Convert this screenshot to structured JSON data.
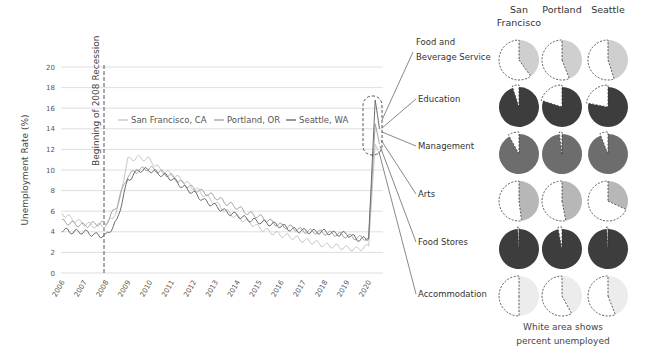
{
  "chart_data": [
    {
      "type": "line",
      "title": "",
      "xlabel": "",
      "ylabel": "Unemployment Rate (%)",
      "ylim": [
        0,
        20
      ],
      "yticks": [
        0,
        2,
        4,
        6,
        8,
        10,
        12,
        14,
        16,
        18,
        20
      ],
      "xticks": [
        "2006",
        "2007",
        "2008",
        "2009",
        "2010",
        "2011",
        "2012",
        "2013",
        "2014",
        "2015",
        "2016",
        "2017",
        "2018",
        "2019",
        "2020"
      ],
      "grid": true,
      "legend_position": "top-center inside",
      "annotation": {
        "label": "Beginning of 2008 Recession",
        "x": 2007.9,
        "style": "dashed vertical line"
      },
      "highlight": {
        "label": "2020 spike",
        "x": 2020.3,
        "y_range": [
          11.5,
          17
        ],
        "style": "dashed rounded rectangle"
      },
      "x": [
        2006.0,
        2006.5,
        2007.0,
        2007.5,
        2008.0,
        2008.5,
        2009.0,
        2009.5,
        2010.0,
        2010.5,
        2011.0,
        2011.5,
        2012.0,
        2012.5,
        2013.0,
        2013.5,
        2014.0,
        2014.5,
        2015.0,
        2015.5,
        2016.0,
        2016.5,
        2017.0,
        2017.5,
        2018.0,
        2018.5,
        2019.0,
        2019.5,
        2020.0,
        2020.3,
        2020.5
      ],
      "series": [
        {
          "name": "San Francisco, CA",
          "color": "#c8c8c8",
          "values": [
            5.8,
            5.2,
            4.8,
            4.6,
            4.6,
            6.0,
            11.0,
            11.2,
            11.0,
            10.0,
            9.6,
            9.0,
            8.3,
            7.6,
            6.8,
            6.0,
            5.4,
            5.0,
            4.4,
            4.0,
            3.7,
            3.5,
            3.2,
            3.0,
            2.7,
            2.6,
            2.4,
            2.3,
            2.6,
            12.5,
            11.5
          ]
        },
        {
          "name": "Portland, OR",
          "color": "#a5a5a5",
          "values": [
            5.0,
            4.8,
            4.6,
            4.8,
            4.8,
            6.5,
            9.5,
            10.0,
            10.2,
            9.8,
            9.4,
            8.7,
            8.2,
            7.8,
            7.4,
            6.8,
            6.4,
            5.8,
            5.5,
            5.0,
            4.6,
            4.4,
            4.1,
            4.0,
            3.9,
            3.8,
            3.6,
            3.4,
            3.4,
            14.5,
            12.5
          ]
        },
        {
          "name": "Seattle, WA",
          "color": "#6e6e6e",
          "values": [
            4.2,
            4.0,
            4.0,
            3.7,
            3.6,
            5.0,
            9.0,
            10.0,
            10.0,
            9.6,
            9.2,
            8.4,
            7.8,
            7.0,
            6.5,
            5.9,
            5.6,
            5.2,
            5.0,
            4.8,
            4.6,
            4.2,
            4.1,
            4.0,
            4.0,
            3.8,
            3.8,
            3.3,
            3.3,
            16.8,
            14.0
          ]
        }
      ]
    },
    {
      "type": "pie",
      "title": "",
      "note": "White area shows percent unemployed",
      "columns": [
        "San Francisco",
        "Portland",
        "Seattle"
      ],
      "rows": [
        {
          "sector": "Food and Beverage Service",
          "color": "#cfcfcf",
          "unemployed_pct": [
            60,
            56,
            55
          ]
        },
        {
          "sector": "Education",
          "color": "#3d3d3d",
          "unemployed_pct": [
            5,
            20,
            22
          ]
        },
        {
          "sector": "Management",
          "color": "#6d6d6d",
          "unemployed_pct": [
            8,
            2,
            6
          ]
        },
        {
          "sector": "Arts",
          "color": "#b7b7b7",
          "unemployed_pct": [
            52,
            53,
            68
          ]
        },
        {
          "sector": "Food Stores",
          "color": "#3d3d3d",
          "unemployed_pct": [
            1,
            3,
            1
          ]
        },
        {
          "sector": "Accommodation",
          "color": "#ececec",
          "unemployed_pct": [
            50,
            58,
            56
          ]
        }
      ]
    }
  ],
  "labels": {
    "ylabel": "Unemployment Rate (%)",
    "recession": "Beginning of 2008 Recession",
    "note_line1": "White area shows",
    "note_line2": "percent unemployed",
    "city_sf_1": "San",
    "city_sf_2": "Francisco",
    "city_pdx": "Portland",
    "city_sea": "Seattle",
    "sector_fbs_1": "Food and",
    "sector_fbs_2": "Beverage Service",
    "sector_edu": "Education",
    "sector_mgmt": "Management",
    "sector_arts": "Arts",
    "sector_fs": "Food Stores",
    "sector_acc": "Accommodation",
    "legend_sf": "San Francisco, CA",
    "legend_pdx": "Portland, OR",
    "legend_sea": "Seattle, WA"
  }
}
